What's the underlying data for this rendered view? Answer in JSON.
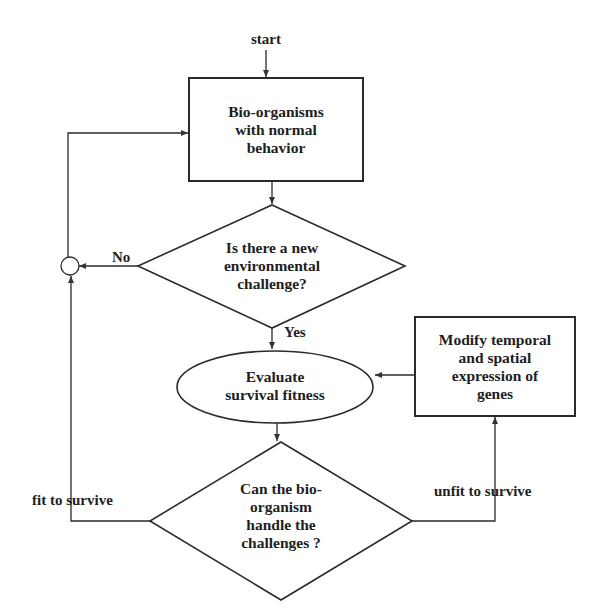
{
  "diagram": {
    "type": "flowchart",
    "start_label": "start",
    "nodes": {
      "normal_behavior": {
        "shape": "rectangle",
        "lines": [
          "Bio-organisms",
          "with normal",
          "behavior"
        ]
      },
      "new_challenge": {
        "shape": "diamond",
        "lines": [
          "Is there a new",
          "environmental",
          "challenge?"
        ]
      },
      "evaluate": {
        "shape": "ellipse",
        "lines": [
          "Evaluate",
          "survival fitness"
        ]
      },
      "modify_genes": {
        "shape": "rectangle",
        "lines": [
          "Modify temporal",
          "and spatial",
          "expression of",
          "genes"
        ]
      },
      "can_handle": {
        "shape": "diamond",
        "lines": [
          "Can the bio-",
          "organism",
          "handle the",
          "challenges  ?"
        ]
      }
    },
    "edge_labels": {
      "no": "No",
      "yes": "Yes",
      "fit": "fit  to survive",
      "unfit": "unfit to survive"
    },
    "edges": [
      {
        "from": "start",
        "to": "normal_behavior"
      },
      {
        "from": "normal_behavior",
        "to": "new_challenge"
      },
      {
        "from": "new_challenge",
        "to": "junction",
        "label": "No"
      },
      {
        "from": "new_challenge",
        "to": "evaluate",
        "label": "Yes"
      },
      {
        "from": "evaluate",
        "to": "can_handle"
      },
      {
        "from": "can_handle",
        "to": "junction",
        "label": "fit  to survive"
      },
      {
        "from": "can_handle",
        "to": "modify_genes",
        "label": "unfit to survive"
      },
      {
        "from": "modify_genes",
        "to": "evaluate"
      },
      {
        "from": "junction",
        "to": "normal_behavior"
      }
    ],
    "colors": {
      "stroke": "#2a2a2a",
      "text": "#1e1e1e",
      "background": "#ffffff"
    }
  }
}
